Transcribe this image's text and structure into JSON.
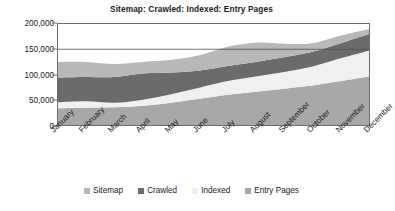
{
  "chart_data": {
    "type": "area",
    "stacked": true,
    "title": "Sitemap: Crawled: Indexed: Entry Pages",
    "xlabel": "",
    "ylabel": "",
    "ylim": [
      0,
      200000
    ],
    "yticks": [
      0,
      50000,
      100000,
      150000,
      200000
    ],
    "ytick_labels": [
      "0",
      "50,000",
      "100,000",
      "150,000",
      "200,000"
    ],
    "grid": false,
    "legend_position": "bottom",
    "categories": [
      "January",
      "February",
      "March",
      "April",
      "May",
      "June",
      "July",
      "August",
      "September",
      "October",
      "November",
      "December"
    ],
    "series": [
      {
        "name": "Entry Pages",
        "color": "#a8a8a8",
        "values": [
          33000,
          34000,
          35000,
          38000,
          44000,
          52000,
          60000,
          66000,
          72000,
          78000,
          87000,
          96000
        ]
      },
      {
        "name": "Indexed",
        "color": "#f0f0f0",
        "values": [
          12000,
          13000,
          9000,
          12000,
          17000,
          22000,
          27000,
          30000,
          33000,
          38000,
          45000,
          51000
        ]
      },
      {
        "name": "Crawled",
        "color": "#6b6b6b",
        "values": [
          49000,
          48000,
          51000,
          52000,
          43000,
          34000,
          30000,
          29000,
          29000,
          29000,
          30000,
          33000
        ]
      },
      {
        "name": "Sitemap",
        "color": "#b8b8b8",
        "values": [
          31000,
          30000,
          26000,
          23000,
          25000,
          30000,
          38000,
          38000,
          27000,
          17000,
          15000,
          10000
        ]
      }
    ],
    "series_order_bottom_to_top": [
      "Entry Pages",
      "Indexed",
      "Crawled",
      "Sitemap"
    ],
    "totals": [
      125000,
      125000,
      121000,
      125000,
      129000,
      138000,
      155000,
      163000,
      161000,
      162000,
      177000,
      190000
    ]
  },
  "legend": {
    "items": [
      {
        "label": "Sitemap",
        "color": "#b8b8b8"
      },
      {
        "label": "Crawled",
        "color": "#6b6b6b"
      },
      {
        "label": "Indexed",
        "color": "#f0f0f0"
      },
      {
        "label": "Entry Pages",
        "color": "#a8a8a8"
      }
    ]
  }
}
